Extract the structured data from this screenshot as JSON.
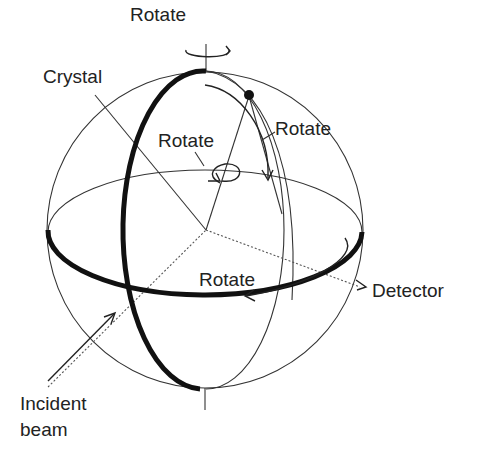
{
  "diagram": {
    "labels": {
      "rotate_top": "Rotate",
      "crystal": "Crystal",
      "rotate_inner": "Rotate",
      "rotate_right": "Rotate",
      "rotate_equator": "Rotate",
      "detector": "Detector",
      "incident_line1": "Incident",
      "incident_line2": "beam"
    },
    "colors": {
      "stroke": "#333333",
      "thick_stroke": "#111111",
      "text": "#222222",
      "background": "#ffffff"
    }
  }
}
